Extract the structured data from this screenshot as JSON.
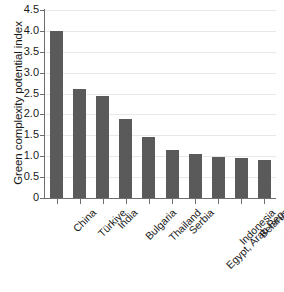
{
  "chart_data": {
    "type": "bar",
    "title": "",
    "subtitle": "",
    "xlabel": "",
    "ylabel": "Green complexity potential index",
    "ylim": [
      0,
      4.5
    ],
    "ytick_labels": [
      "4.5",
      "4.0",
      "3.5",
      "3.0",
      "2.5",
      "2.0",
      "1.5",
      "1.0",
      "0.5",
      "0"
    ],
    "ytick_values": [
      4.5,
      4.0,
      3.5,
      3.0,
      2.5,
      2.0,
      1.5,
      1.0,
      0.5,
      0
    ],
    "grid": "horizontal",
    "legend": "none",
    "bar_color": "#5a5a5a",
    "gridline_color": "#e8e8e8",
    "axis_color": "#6e6e6e",
    "categories": [
      "China",
      "Türkiye",
      "India",
      "Bulgaria",
      "Thailand",
      "Serbia",
      "Egypt, Arab Rep.",
      "Indonesia",
      "Belarus",
      "Viet Nam"
    ],
    "values": [
      4.0,
      2.6,
      2.45,
      1.9,
      1.45,
      1.15,
      1.05,
      0.98,
      0.95,
      0.9
    ],
    "series": [
      {
        "name": "Green complexity potential index",
        "values": [
          4.0,
          2.6,
          2.45,
          1.9,
          1.45,
          1.15,
          1.05,
          0.98,
          0.95,
          0.9
        ]
      }
    ]
  }
}
